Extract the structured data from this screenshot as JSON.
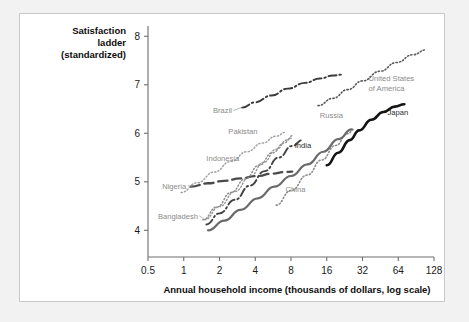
{
  "figure": {
    "background_color": "#ffffff",
    "page_background_color": "#f2f2f2",
    "border_color": "#c9c9cc"
  },
  "axis_titles": {
    "y_line1": "Satisfaction",
    "y_line2": "ladder",
    "y_line3": "(standardized)",
    "x": "Annual household income (thousands of dollars, log scale)"
  },
  "ticks": {
    "y": [
      "8",
      "7",
      "6",
      "5",
      "4"
    ],
    "x": [
      "0.5",
      "1",
      "2",
      "4",
      "8",
      "16",
      "32",
      "64",
      "128"
    ]
  },
  "labels": {
    "brazil": "Brazil",
    "usa_line1": "United States",
    "usa_line2": "of America",
    "pakistan": "Pakistan",
    "india": "India",
    "russia": "Russia",
    "japan": "Japan",
    "indonesia": "Indonesia",
    "nigeria": "Nigeria",
    "bangladesh": "Bangladesh",
    "china": "China"
  },
  "chart_data": {
    "type": "line",
    "title": "",
    "xlabel": "Annual household income (thousands of dollars, log scale)",
    "ylabel": "Satisfaction ladder (standardized)",
    "x_scale": "log2",
    "xlim": [
      0.5,
      128
    ],
    "ylim": [
      3.45,
      8.15
    ],
    "xticks": [
      0.5,
      1,
      2,
      4,
      8,
      16,
      32,
      64,
      128
    ],
    "yticks": [
      4,
      5,
      6,
      7,
      8
    ],
    "grid": false,
    "legend": "inline-labels",
    "series": [
      {
        "name": "Brazil",
        "style": "dash-dot",
        "color": "#3a3a3a",
        "width": 1.9,
        "x": [
          3.1,
          4.0,
          5.5,
          7.5,
          10.5,
          14.0,
          18.0,
          21.5
        ],
        "y": [
          6.53,
          6.64,
          6.78,
          6.92,
          7.04,
          7.13,
          7.19,
          7.21
        ]
      },
      {
        "name": "United States of America",
        "style": "dotted",
        "color": "#5a5a5a",
        "width": 1.6,
        "x": [
          13.5,
          18.0,
          24.0,
          32.0,
          45.0,
          62.0,
          85.0,
          110.0
        ],
        "y": [
          6.57,
          6.72,
          6.9,
          7.08,
          7.28,
          7.46,
          7.62,
          7.72
        ]
      },
      {
        "name": "Japan",
        "style": "solid",
        "color": "#141414",
        "width": 2.6,
        "x": [
          16.0,
          20.0,
          25.0,
          30.0,
          38.0,
          48.0,
          60.0,
          72.0
        ],
        "y": [
          5.34,
          5.6,
          5.86,
          6.06,
          6.28,
          6.44,
          6.55,
          6.6
        ]
      },
      {
        "name": "Russia",
        "style": "dotted",
        "color": "#8c8c8c",
        "width": 1.6,
        "x": [
          6.0,
          8.0,
          11.0,
          14.5,
          19.0,
          24.0,
          27.0
        ],
        "y": [
          4.52,
          4.82,
          5.14,
          5.45,
          5.75,
          5.99,
          6.08
        ]
      },
      {
        "name": "India",
        "style": "dash-dot",
        "color": "#444444",
        "width": 1.9,
        "x": [
          1.55,
          2.0,
          2.7,
          3.6,
          4.8,
          6.3,
          8.2,
          10.0
        ],
        "y": [
          4.12,
          4.35,
          4.63,
          4.92,
          5.22,
          5.5,
          5.74,
          5.86
        ]
      },
      {
        "name": "Pakistan",
        "style": "dotted",
        "color": "#9a9a9a",
        "width": 1.5,
        "x": [
          1.5,
          2.0,
          2.7,
          3.6,
          4.7,
          6.0,
          7.4,
          8.2
        ],
        "y": [
          4.22,
          4.49,
          4.8,
          5.1,
          5.4,
          5.67,
          5.86,
          5.95
        ]
      },
      {
        "name": "Indonesia",
        "style": "dotted",
        "color": "#a3a3a3",
        "width": 1.5,
        "x": [
          0.95,
          1.3,
          1.8,
          2.5,
          3.4,
          4.6,
          6.0,
          7.2
        ],
        "y": [
          4.78,
          4.98,
          5.2,
          5.42,
          5.62,
          5.8,
          5.94,
          6.02
        ]
      },
      {
        "name": "Nigeria",
        "style": "long-dash",
        "color": "#4a4a4a",
        "width": 2.3,
        "x": [
          1.15,
          1.6,
          2.2,
          3.0,
          4.1,
          5.6,
          7.0,
          8.2
        ],
        "y": [
          4.9,
          4.97,
          5.02,
          5.07,
          5.12,
          5.17,
          5.2,
          5.21
        ]
      },
      {
        "name": "Bangladesh",
        "style": "dotted",
        "color": "#8f8f8f",
        "width": 1.5,
        "x": [
          1.45,
          1.9,
          2.5,
          3.3,
          4.3,
          5.6,
          7.0,
          8.0
        ],
        "y": [
          4.22,
          4.48,
          4.78,
          5.06,
          5.34,
          5.6,
          5.8,
          5.9
        ]
      },
      {
        "name": "China",
        "style": "solid",
        "color": "#6a6a6a",
        "width": 2.2,
        "x": [
          1.6,
          2.2,
          3.0,
          4.2,
          5.8,
          8.0,
          11.0,
          15.0,
          20.0,
          26.0
        ],
        "y": [
          4.0,
          4.2,
          4.42,
          4.66,
          4.9,
          5.12,
          5.36,
          5.62,
          5.88,
          6.08
        ]
      }
    ]
  }
}
